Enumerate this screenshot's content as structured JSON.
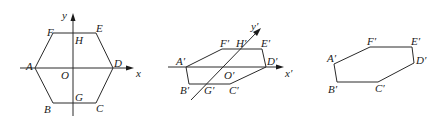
{
  "figures": [
    {
      "id": "original-hexagon",
      "axes": {
        "x_label": "x",
        "y_label": "y",
        "origin_label": "O"
      },
      "vertices": {
        "A": "A",
        "B": "B",
        "C": "C",
        "D": "D",
        "E": "E",
        "F": "F"
      },
      "axis_points": {
        "H": "H",
        "G": "G"
      }
    },
    {
      "id": "oblique-axes-hexagon",
      "axes": {
        "x_label": "x′",
        "y_label": "y′",
        "origin_label": "O′"
      },
      "vertices": {
        "A": "A′",
        "B": "B′",
        "C": "C′",
        "D": "D′",
        "E": "E′",
        "F": "F′"
      },
      "axis_points": {
        "H": "H′",
        "G": "G′"
      }
    },
    {
      "id": "intuitive-drawing-hexagon",
      "vertices": {
        "A": "A′",
        "B": "B′",
        "C": "C′",
        "D": "D′",
        "E": "E′",
        "F": "F′"
      }
    }
  ]
}
